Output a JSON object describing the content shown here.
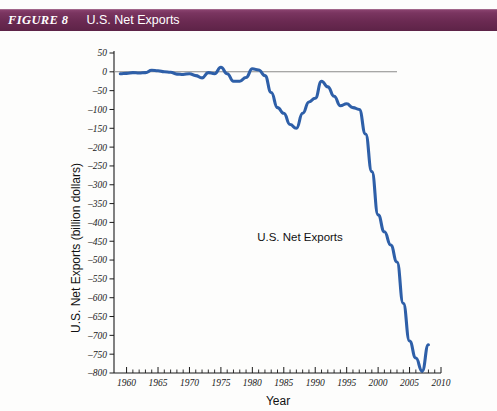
{
  "banner": {
    "figure_number": "FIGURE 8",
    "title": "U.S. Net Exports",
    "background_color": "#6B2A52",
    "text_color": "#FFFFFF"
  },
  "chart_data": {
    "type": "line",
    "title": "U.S. Net Exports",
    "annotation": "U.S. Net Exports",
    "xlabel": "Year",
    "ylabel": "U.S. Net Exports (billion dollars)",
    "series_color": "#2E5FA8",
    "zero_line_color": "#8A8A8A",
    "grid": false,
    "legend_position": "none",
    "xlim": [
      1958,
      2010
    ],
    "ylim": [
      -800,
      50
    ],
    "xticks": [
      1960,
      1965,
      1970,
      1975,
      1980,
      1985,
      1990,
      1995,
      2000,
      2005,
      2010
    ],
    "xtick_labels": [
      "1960",
      "1965",
      "1970",
      "1975",
      "1980",
      "1985",
      "1990",
      "1995",
      "2000",
      "2005",
      "2010"
    ],
    "xtick_minor_step": 1,
    "yticks": [
      50,
      0,
      -50,
      -100,
      -150,
      -200,
      -250,
      -300,
      -350,
      -400,
      -450,
      -500,
      -550,
      -600,
      -650,
      -700,
      -750,
      -800
    ],
    "ytick_labels": [
      "50",
      "0",
      "-50",
      "-100",
      "-150",
      "-200",
      "-250",
      "-300",
      "-350",
      "-400",
      "-450",
      "-500",
      "-550",
      "-600",
      "-650",
      "-700",
      "-750",
      "-800"
    ],
    "x": [
      1959,
      1960,
      1961,
      1962,
      1963,
      1964,
      1965,
      1966,
      1967,
      1968,
      1969,
      1970,
      1971,
      1972,
      1973,
      1974,
      1975,
      1976,
      1977,
      1978,
      1979,
      1980,
      1981,
      1982,
      1983,
      1984,
      1985,
      1986,
      1987,
      1988,
      1989,
      1990,
      1991,
      1992,
      1993,
      1994,
      1995,
      1996,
      1997,
      1998,
      1999,
      2000,
      2001,
      2002,
      2003,
      2004,
      2005,
      2006,
      2007,
      2008
    ],
    "values": [
      -5,
      -4,
      -2,
      -3,
      -2,
      4,
      3,
      0,
      -1,
      -6,
      -7,
      -5,
      -10,
      -16,
      -2,
      -5,
      12,
      -5,
      -25,
      -25,
      -15,
      8,
      5,
      -10,
      -55,
      -95,
      -110,
      -140,
      -150,
      -110,
      -80,
      -70,
      -25,
      -40,
      -65,
      -90,
      -85,
      -95,
      -100,
      -165,
      -265,
      -380,
      -425,
      -460,
      -505,
      -615,
      -715,
      -760,
      -795,
      -725
    ],
    "units": "billion dollars",
    "notable_points": [
      {
        "year": 1975,
        "value": 12,
        "note": "positive peak"
      },
      {
        "year": 1980,
        "value": 8,
        "note": "positive peak"
      },
      {
        "year": 1987,
        "value": -150,
        "note": "trough"
      },
      {
        "year": 1991,
        "value": -25,
        "note": "partial recovery peak"
      },
      {
        "year": 2001,
        "value": -425,
        "note": "plateau"
      },
      {
        "year": 2007,
        "value": -795,
        "note": "deepest deficit"
      }
    ]
  }
}
